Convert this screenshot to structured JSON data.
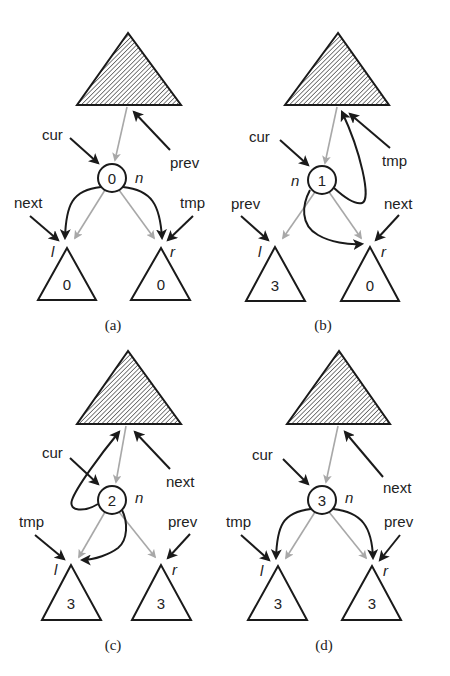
{
  "figure": {
    "colors": {
      "ink": "#1a1a1a",
      "gray_link": "#a8a8a8",
      "hatch": "#555555",
      "background": "#ffffff"
    },
    "panels": [
      {
        "caption": "(a)",
        "node_value": "0",
        "node_label": "n",
        "left_subtree": {
          "label": "l",
          "value": "0"
        },
        "right_subtree": {
          "label": "r",
          "value": "0"
        },
        "pointers": {
          "cur": "node n",
          "prev": "parent subtree",
          "next": "left subtree l",
          "tmp": "right subtree r"
        },
        "labels": [
          "cur",
          "prev",
          "next",
          "tmp"
        ]
      },
      {
        "caption": "(b)",
        "node_value": "1",
        "node_label": "n",
        "left_subtree": {
          "label": "l",
          "value": "3"
        },
        "right_subtree": {
          "label": "r",
          "value": "0"
        },
        "pointers": {
          "cur": "node n",
          "tmp": "parent subtree",
          "prev": "left subtree l",
          "next": "right subtree r"
        },
        "labels": [
          "cur",
          "tmp",
          "prev",
          "next"
        ]
      },
      {
        "caption": "(c)",
        "node_value": "2",
        "node_label": "n",
        "left_subtree": {
          "label": "l",
          "value": "3"
        },
        "right_subtree": {
          "label": "r",
          "value": "3"
        },
        "pointers": {
          "cur": "node n",
          "next": "parent subtree",
          "tmp": "left subtree l",
          "prev": "right subtree r"
        },
        "labels": [
          "cur",
          "next",
          "tmp",
          "prev"
        ]
      },
      {
        "caption": "(d)",
        "node_value": "3",
        "node_label": "n",
        "left_subtree": {
          "label": "l",
          "value": "3"
        },
        "right_subtree": {
          "label": "r",
          "value": "3"
        },
        "pointers": {
          "cur": "node n",
          "next": "parent subtree",
          "tmp": "left subtree l",
          "prev": "right subtree r"
        },
        "labels": [
          "cur",
          "next",
          "tmp",
          "prev"
        ]
      }
    ]
  }
}
